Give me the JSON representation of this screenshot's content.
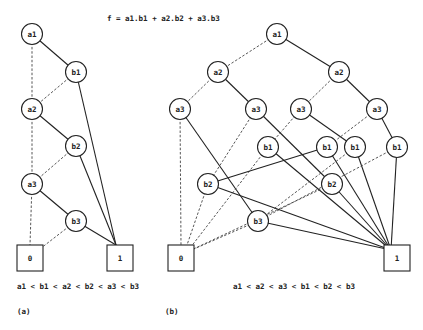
{
  "formula": "f = a1.b1 + a2.b2 + a3.b3",
  "diagrams": {
    "a": {
      "caption": "(a)",
      "ordering": "a1 < b1 < a2 < b2 < a3 < b3",
      "nodes": [
        {
          "id": "a1",
          "label": "a1",
          "x": 32,
          "y": 34,
          "type": "var"
        },
        {
          "id": "b1",
          "label": "b1",
          "x": 76,
          "y": 72,
          "type": "var"
        },
        {
          "id": "a2",
          "label": "a2",
          "x": 32,
          "y": 109,
          "type": "var"
        },
        {
          "id": "b2",
          "label": "b2",
          "x": 76,
          "y": 146,
          "type": "var"
        },
        {
          "id": "a3",
          "label": "a3",
          "x": 32,
          "y": 184,
          "type": "var"
        },
        {
          "id": "b3",
          "label": "b3",
          "x": 76,
          "y": 221,
          "type": "var"
        },
        {
          "id": "t0",
          "label": "0",
          "x": 30,
          "y": 258,
          "type": "terminal"
        },
        {
          "id": "t1",
          "label": "1",
          "x": 120,
          "y": 258,
          "type": "terminal"
        }
      ],
      "edges": [
        {
          "from": "a1",
          "to": "a2",
          "style": "dashed"
        },
        {
          "from": "a1",
          "to": "b1",
          "style": "solid"
        },
        {
          "from": "b1",
          "to": "a2",
          "style": "dashed"
        },
        {
          "from": "b1",
          "to": "t1",
          "style": "solid"
        },
        {
          "from": "a2",
          "to": "a3",
          "style": "dashed"
        },
        {
          "from": "a2",
          "to": "b2",
          "style": "solid"
        },
        {
          "from": "b2",
          "to": "a3",
          "style": "dashed"
        },
        {
          "from": "b2",
          "to": "t1",
          "style": "solid"
        },
        {
          "from": "a3",
          "to": "t0",
          "style": "dashed"
        },
        {
          "from": "a3",
          "to": "b3",
          "style": "solid"
        },
        {
          "from": "b3",
          "to": "t0",
          "style": "dashed"
        },
        {
          "from": "b3",
          "to": "t1",
          "style": "solid"
        }
      ]
    },
    "b": {
      "caption": "(b)",
      "ordering": "a1 < a2 < a3 < b1 < b2 < b3",
      "nodes": [
        {
          "id": "a1",
          "label": "a1",
          "x": 277,
          "y": 34,
          "type": "var"
        },
        {
          "id": "a2L",
          "label": "a2",
          "x": 218,
          "y": 72,
          "type": "var"
        },
        {
          "id": "a2R",
          "label": "a2",
          "x": 339,
          "y": 72,
          "type": "var"
        },
        {
          "id": "a3A",
          "label": "a3",
          "x": 180,
          "y": 109,
          "type": "var"
        },
        {
          "id": "a3B",
          "label": "a3",
          "x": 256,
          "y": 109,
          "type": "var"
        },
        {
          "id": "a3C",
          "label": "a3",
          "x": 301,
          "y": 109,
          "type": "var"
        },
        {
          "id": "a3D",
          "label": "a3",
          "x": 377,
          "y": 109,
          "type": "var"
        },
        {
          "id": "b1A",
          "label": "b1",
          "x": 268,
          "y": 147,
          "type": "var"
        },
        {
          "id": "b1B",
          "label": "b1",
          "x": 327,
          "y": 147,
          "type": "var"
        },
        {
          "id": "b1C",
          "label": "b1",
          "x": 355,
          "y": 147,
          "type": "var"
        },
        {
          "id": "b1D",
          "label": "b1",
          "x": 397,
          "y": 147,
          "type": "var"
        },
        {
          "id": "b2A",
          "label": "b2",
          "x": 208,
          "y": 184,
          "type": "var"
        },
        {
          "id": "b2B",
          "label": "b2",
          "x": 332,
          "y": 184,
          "type": "var"
        },
        {
          "id": "b3",
          "label": "b3",
          "x": 258,
          "y": 221,
          "type": "var"
        },
        {
          "id": "t0",
          "label": "0",
          "x": 181,
          "y": 258,
          "type": "terminal"
        },
        {
          "id": "t1",
          "label": "1",
          "x": 397,
          "y": 258,
          "type": "terminal"
        }
      ],
      "edges": [
        {
          "from": "a1",
          "to": "a2L",
          "style": "dashed"
        },
        {
          "from": "a1",
          "to": "a2R",
          "style": "solid"
        },
        {
          "from": "a2L",
          "to": "a3A",
          "style": "dashed"
        },
        {
          "from": "a2L",
          "to": "a3B",
          "style": "solid"
        },
        {
          "from": "a2R",
          "to": "a3C",
          "style": "dashed"
        },
        {
          "from": "a2R",
          "to": "a3D",
          "style": "solid"
        },
        {
          "from": "a3A",
          "to": "t0",
          "style": "dashed"
        },
        {
          "from": "a3A",
          "to": "b3",
          "style": "solid"
        },
        {
          "from": "a3B",
          "to": "b2A",
          "style": "dashed"
        },
        {
          "from": "a3B",
          "to": "b2B",
          "style": "solid"
        },
        {
          "from": "a3C",
          "to": "b1A",
          "style": "dashed"
        },
        {
          "from": "a3C",
          "to": "b1C",
          "style": "solid"
        },
        {
          "from": "a3D",
          "to": "b1B",
          "style": "dashed"
        },
        {
          "from": "a3D",
          "to": "b1D",
          "style": "solid"
        },
        {
          "from": "b1A",
          "to": "t0",
          "style": "dashed"
        },
        {
          "from": "b1A",
          "to": "t1",
          "style": "solid"
        },
        {
          "from": "b1B",
          "to": "b2A",
          "style": "solid"
        },
        {
          "from": "b1B",
          "to": "t1",
          "style": "solid"
        },
        {
          "from": "b1C",
          "to": "b3",
          "style": "dashed"
        },
        {
          "from": "b1C",
          "to": "t1",
          "style": "solid"
        },
        {
          "from": "b1D",
          "to": "b3",
          "style": "dashed"
        },
        {
          "from": "b1D",
          "to": "t1",
          "style": "solid"
        },
        {
          "from": "b2A",
          "to": "t0",
          "style": "dashed"
        },
        {
          "from": "b2A",
          "to": "t1",
          "style": "solid"
        },
        {
          "from": "b2B",
          "to": "t0",
          "style": "dashed"
        },
        {
          "from": "b2B",
          "to": "t1",
          "style": "solid"
        },
        {
          "from": "b3",
          "to": "t0",
          "style": "dashed"
        },
        {
          "from": "b3",
          "to": "t1",
          "style": "solid"
        }
      ]
    }
  }
}
